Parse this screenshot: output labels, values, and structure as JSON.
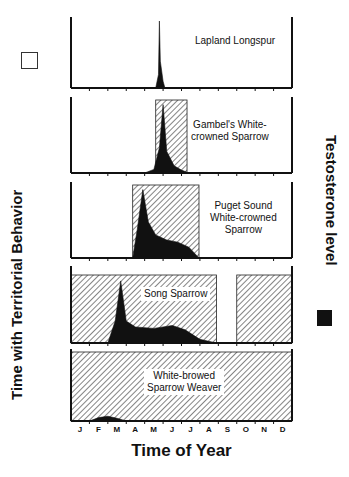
{
  "chart_data": {
    "type": "area",
    "title": "",
    "xlabel": "Time of Year",
    "ylabel_left": "Time with Territorial Behavior",
    "ylabel_right": "Testosterone level",
    "categories": [
      "J",
      "F",
      "M",
      "A",
      "M",
      "J",
      "J",
      "A",
      "S",
      "O",
      "N",
      "D"
    ],
    "legend": [
      {
        "name": "Time with Territorial Behavior",
        "style": "hatched",
        "position": "left"
      },
      {
        "name": "Testosterone level",
        "style": "solid-black",
        "position": "right"
      }
    ],
    "panels": [
      {
        "species": "Lapland Longspur",
        "territorial_months": [
          [
            4.8,
            4.9
          ]
        ],
        "testosterone": {
          "x": [
            4.6,
            4.75,
            4.8,
            4.85,
            5.0,
            5.1
          ],
          "y": [
            0,
            0.2,
            1.0,
            0.4,
            0.1,
            0
          ]
        }
      },
      {
        "species": "Gambel's White-crowned Sparrow",
        "territorial_months": [
          [
            4.6,
            6.3
          ]
        ],
        "testosterone": {
          "x": [
            4.0,
            4.5,
            4.8,
            5.0,
            5.2,
            5.6,
            6.0,
            6.4
          ],
          "y": [
            0,
            0.05,
            0.35,
            0.95,
            0.3,
            0.1,
            0.04,
            0
          ]
        }
      },
      {
        "species": "Puget Sound White-crowned Sparrow",
        "territorial_months": [
          [
            3.35,
            6.95
          ]
        ],
        "testosterone": {
          "x": [
            3.35,
            3.6,
            3.9,
            4.2,
            4.6,
            5.2,
            5.8,
            6.4,
            6.95
          ],
          "y": [
            0,
            0.4,
            0.95,
            0.5,
            0.32,
            0.25,
            0.22,
            0.15,
            0
          ]
        }
      },
      {
        "species": "Song Sparrow",
        "territorial_months": [
          [
            0.0,
            7.9
          ],
          [
            9.0,
            12.0
          ]
        ],
        "testosterone": {
          "x": [
            2.0,
            2.4,
            2.7,
            3.0,
            3.5,
            4.5,
            5.5,
            6.2,
            7.0,
            7.9
          ],
          "y": [
            0,
            0.3,
            0.85,
            0.3,
            0.22,
            0.2,
            0.24,
            0.18,
            0.05,
            0
          ]
        }
      },
      {
        "species": "White-browed Sparrow Weaver",
        "territorial_months": [
          [
            0.0,
            12.0
          ]
        ],
        "testosterone": {
          "x": [
            1.0,
            1.5,
            2.0,
            2.5,
            3.0
          ],
          "y": [
            0,
            0.05,
            0.07,
            0.04,
            0
          ]
        }
      }
    ]
  },
  "labels": {
    "p1": "Lapland Longspur",
    "p2a": "Gambel's White-",
    "p2b": "crowned Sparrow",
    "p3a": "Puget Sound",
    "p3b": "White-crowned",
    "p3c": "Sparrow",
    "p4": "Song Sparrow",
    "p5a": "White-browed",
    "p5b": "Sparrow Weaver",
    "ylabel_left": "Time with Territorial Behavior",
    "ylabel_right": "Testosterone level",
    "xlabel": "Time of Year",
    "months": [
      "J",
      "F",
      "M",
      "A",
      "M",
      "J",
      "J",
      "A",
      "S",
      "O",
      "N",
      "D"
    ]
  }
}
